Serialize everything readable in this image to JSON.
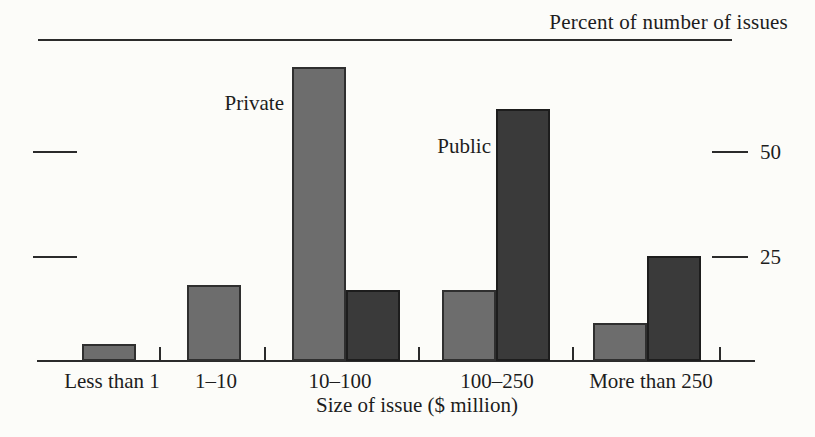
{
  "chart_data": {
    "type": "bar",
    "title": "Percent of number of issues",
    "xlabel": "Size of issue ($ million)",
    "ylabel": "",
    "categories": [
      "Less than 1",
      "1–10",
      "10–100",
      "100–250",
      "More than 250"
    ],
    "series": [
      {
        "name": "Private",
        "color": "#6d6d6d",
        "border_color": "#2f2f2f",
        "values": [
          4,
          18,
          70,
          17,
          9
        ]
      },
      {
        "name": "Public",
        "color": "#3a3a3a",
        "border_color": "#1d1d1d",
        "values": [
          0,
          0,
          17,
          60,
          25
        ]
      }
    ],
    "yticks": [
      {
        "value": 50,
        "label": "50"
      },
      {
        "value": 25,
        "label": "25"
      }
    ],
    "ylim": [
      0,
      75
    ],
    "grid": false,
    "legend_position": "in-plot text annotations",
    "annotations": [
      {
        "text": "Private",
        "series": "Private",
        "category": "10–100"
      },
      {
        "text": "Public",
        "series": "Public",
        "category": "100–250"
      }
    ],
    "axis_color": "#2b2b2b",
    "background_color": "#fcfcf9"
  }
}
